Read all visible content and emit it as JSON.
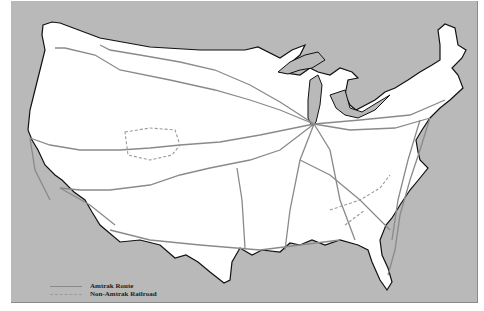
{
  "map": {
    "subject": "United States rail routes",
    "colors": {
      "background": "#b9b9b9",
      "land": "#ffffff",
      "coastline": "#111111",
      "route": "#8a8a8a"
    }
  },
  "legend": {
    "items": [
      {
        "label": "Amtrak Route",
        "style": "solid"
      },
      {
        "label": "Non-Amtrak Railroad",
        "style": "dashed"
      }
    ]
  }
}
